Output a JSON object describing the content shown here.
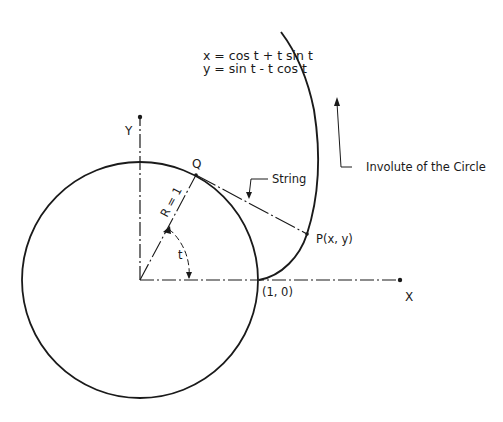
{
  "diagram": {
    "equations": {
      "x": "x = cos t + t sin t",
      "y": "y = sin t - t cos t"
    },
    "labels": {
      "y_axis": "Y",
      "x_axis": "X",
      "point_q": "Q",
      "radius": "R = 1",
      "angle": "t",
      "string": "String",
      "point_p": "P(x, y)",
      "start_point": "(1, 0)",
      "involute": "Involute of the Circle"
    },
    "colors": {
      "stroke": "#1a1a1a",
      "background": "#ffffff"
    },
    "geometry": {
      "circle_radius": 1,
      "start_point": [
        1,
        0
      ]
    }
  }
}
